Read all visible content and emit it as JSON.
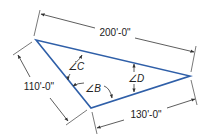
{
  "diagram": {
    "type": "triangle-dimension-drawing",
    "colors": {
      "triangle_stroke": "#2f5fa8",
      "dimension_stroke": "#333333",
      "text": "#222222",
      "background": "#ffffff"
    },
    "vertices": {
      "top_left": [
        36,
        40
      ],
      "bottom": [
        91,
        108
      ],
      "right": [
        190,
        76
      ]
    },
    "dimensions": [
      {
        "id": "top",
        "label": "200'-0\"",
        "side": "top-left to right"
      },
      {
        "id": "left",
        "label": "110'-0\"",
        "side": "top-left to bottom"
      },
      {
        "id": "bottom",
        "label": "130'-0\"",
        "side": "bottom to right"
      }
    ],
    "angles": [
      {
        "id": "C",
        "label": "∠C"
      },
      {
        "id": "B",
        "label": "∠B"
      },
      {
        "id": "D",
        "label": "∠D"
      }
    ]
  }
}
